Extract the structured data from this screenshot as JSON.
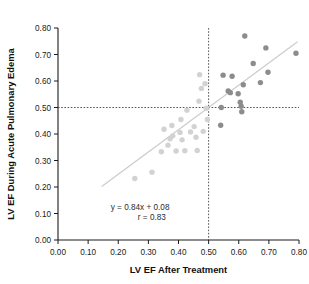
{
  "chart_data": {
    "type": "scatter",
    "title": "",
    "xlabel": "LV EF After Treatment",
    "ylabel": "LV EF During Acute Pulmonary Edema",
    "xlim": [
      0.0,
      0.8
    ],
    "ylim": [
      0.0,
      0.8
    ],
    "xticks": [
      "0.00",
      "0.10",
      "0.20",
      "0.30",
      "0.40",
      "0.50",
      "0.60",
      "0.70",
      "0.80"
    ],
    "yticks": [
      "0.00",
      "0.10",
      "0.20",
      "0.30",
      "0.40",
      "0.50",
      "0.60",
      "0.70",
      "0.80"
    ],
    "xtick_values": [
      0.0,
      0.1,
      0.2,
      0.3,
      0.4,
      0.5,
      0.6,
      0.7,
      0.8
    ],
    "ytick_values": [
      0.0,
      0.1,
      0.2,
      0.3,
      0.4,
      0.5,
      0.6,
      0.7,
      0.8
    ],
    "grid": false,
    "legend": null,
    "annotations": {
      "equation": "y = 0.84x + 0.08",
      "correlation": "r = 0.83",
      "equation_x": 0.175,
      "equation_y": 0.115,
      "correlation_x": 0.265,
      "correlation_y": 0.075
    },
    "regression_line": {
      "slope": 0.84,
      "intercept": 0.08,
      "x_start": 0.145,
      "x_end": 0.795,
      "color": "#cccccc"
    },
    "reference_lines": [
      {
        "axis": "vertical",
        "value": 0.5,
        "style": "dotted",
        "color": "#555555"
      },
      {
        "axis": "horizontal",
        "value": 0.5,
        "style": "dotted",
        "color": "#555555"
      }
    ],
    "series": [
      {
        "name": "below-cutoff",
        "color": "#d2d2d2",
        "points": [
          [
            0.255,
            0.232
          ],
          [
            0.312,
            0.256
          ],
          [
            0.343,
            0.333
          ],
          [
            0.352,
            0.418
          ],
          [
            0.365,
            0.358
          ],
          [
            0.372,
            0.382
          ],
          [
            0.378,
            0.432
          ],
          [
            0.381,
            0.393
          ],
          [
            0.392,
            0.336
          ],
          [
            0.405,
            0.406
          ],
          [
            0.408,
            0.455
          ],
          [
            0.412,
            0.378
          ],
          [
            0.421,
            0.337
          ],
          [
            0.428,
            0.49
          ],
          [
            0.44,
            0.408
          ],
          [
            0.452,
            0.428
          ],
          [
            0.458,
            0.388
          ],
          [
            0.462,
            0.338
          ],
          [
            0.468,
            0.524
          ],
          [
            0.47,
            0.624
          ],
          [
            0.476,
            0.572
          ],
          [
            0.482,
            0.41
          ],
          [
            0.488,
            0.59
          ],
          [
            0.492,
            0.497
          ],
          [
            0.496,
            0.455
          ]
        ]
      },
      {
        "name": "above-cutoff",
        "color": "#8c8c8c",
        "points": [
          [
            0.54,
            0.433
          ],
          [
            0.542,
            0.5
          ],
          [
            0.548,
            0.622
          ],
          [
            0.565,
            0.562
          ],
          [
            0.572,
            0.556
          ],
          [
            0.578,
            0.618
          ],
          [
            0.598,
            0.552
          ],
          [
            0.605,
            0.52
          ],
          [
            0.608,
            0.505
          ],
          [
            0.61,
            0.484
          ],
          [
            0.615,
            0.586
          ],
          [
            0.62,
            0.77
          ],
          [
            0.648,
            0.666
          ],
          [
            0.672,
            0.594
          ],
          [
            0.69,
            0.725
          ],
          [
            0.697,
            0.633
          ],
          [
            0.79,
            0.705
          ]
        ]
      }
    ]
  }
}
